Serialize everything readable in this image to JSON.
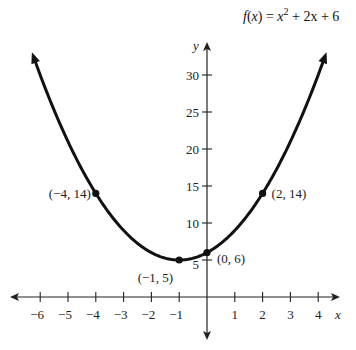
{
  "chart_data": {
    "type": "line",
    "title_parts": {
      "f": "f",
      "x": "x",
      "eq": " = ",
      "x2": "x",
      "sup": "2",
      "rest": " + 2x + 6"
    },
    "xlabel": "x",
    "ylabel": "y",
    "xlim": [
      -6.5,
      4.5
    ],
    "ylim": [
      0,
      32
    ],
    "grid": false,
    "x_ticks": [
      -6,
      -5,
      -4,
      -3,
      -2,
      -1,
      1,
      2,
      3,
      4
    ],
    "x_tick_labels": [
      "−6",
      "−5",
      "−4",
      "−3",
      "−2",
      "−1",
      "1",
      "2",
      "3",
      "4"
    ],
    "y_ticks": [
      5,
      10,
      15,
      20,
      25,
      30
    ],
    "y_tick_labels": [
      "5",
      "10",
      "15",
      "20",
      "25",
      "30"
    ],
    "function": {
      "a": 1,
      "b": 2,
      "c": 6,
      "domain_drawn": [
        -6.25,
        4.25
      ]
    },
    "points": [
      {
        "x": -4,
        "y": 14,
        "label": "(−4, 14)"
      },
      {
        "x": -1,
        "y": 5,
        "label": "(−1, 5)"
      },
      {
        "x": 0,
        "y": 6,
        "label": "(0, 6)"
      },
      {
        "x": 2,
        "y": 14,
        "label": "(2, 14)"
      }
    ],
    "colors": {
      "curve": "#111111",
      "axis": "#222222"
    }
  }
}
